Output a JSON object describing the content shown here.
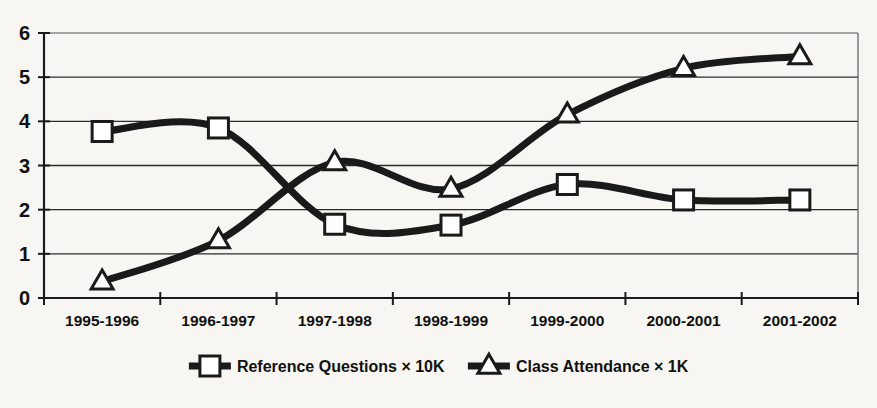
{
  "chart_data": {
    "type": "line",
    "title": "",
    "xlabel": "",
    "ylabel": "",
    "categories": [
      "1995-1996",
      "1996-1997",
      "1997-1998",
      "1998-1999",
      "1999-2000",
      "2000-2001",
      "2001-2002"
    ],
    "series": [
      {
        "name": "Reference Questions × 10K",
        "marker": "square",
        "values": [
          3.77,
          3.85,
          1.67,
          1.65,
          2.57,
          2.22,
          2.22
        ]
      },
      {
        "name": "Class Attendance × 1K",
        "marker": "triangle",
        "values": [
          0.37,
          1.3,
          3.07,
          2.47,
          4.15,
          5.2,
          5.47
        ]
      }
    ],
    "ylim": [
      0,
      6
    ],
    "yticks": [
      0,
      1,
      2,
      3,
      4,
      5,
      6
    ],
    "ytick_labels": [
      "0",
      "1",
      "2",
      "3",
      "4",
      "5",
      "6"
    ],
    "grid": true,
    "legend_position": "bottom",
    "line_color": "#1a1a1a",
    "marker_fill": "#ffffff",
    "background": "#f7f6f2"
  },
  "legend": {
    "items": [
      {
        "label": "Reference Questions × 10K",
        "marker": "square"
      },
      {
        "label": "Class Attendance × 1K",
        "marker": "triangle"
      }
    ]
  }
}
